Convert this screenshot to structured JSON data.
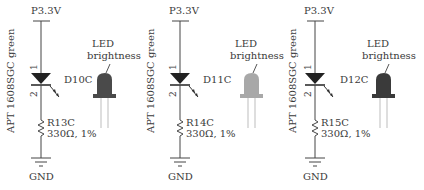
{
  "diagram": {
    "type": "LED brightness schematic comparison",
    "circuits": [
      {
        "rail": "P3.3V",
        "led_part": "APT 1608SGC green",
        "designator": "D10C",
        "pin1": "1",
        "pin2": "2",
        "resistor_designator": "R13C",
        "resistor_value": "330Ω, 1%",
        "ground": "GND",
        "brightness_label_line1": "LED",
        "brightness_label_line2": "brightness",
        "bulb_color": "#4a4a4a"
      },
      {
        "rail": "P3.3V",
        "led_part": "APT 1608SGC green",
        "designator": "D11C",
        "pin1": "1",
        "pin2": "2",
        "resistor_designator": "R14C",
        "resistor_value": "330Ω, 1%",
        "ground": "GND",
        "brightness_label_line1": "LED",
        "brightness_label_line2": "brightness",
        "bulb_color": "#a8a8a8"
      },
      {
        "rail": "P3.3V",
        "led_part": "APT 1608SGC green",
        "designator": "D12C",
        "pin1": "1",
        "pin2": "2",
        "resistor_designator": "R15C",
        "resistor_value": "330Ω, 1%",
        "ground": "GND",
        "brightness_label_line1": "LED",
        "brightness_label_line2": "brightness",
        "bulb_color": "#3a3a3a"
      }
    ],
    "colors": {
      "wire": "#444444",
      "diode": "#222222",
      "leads": "#bdbdbd"
    }
  }
}
